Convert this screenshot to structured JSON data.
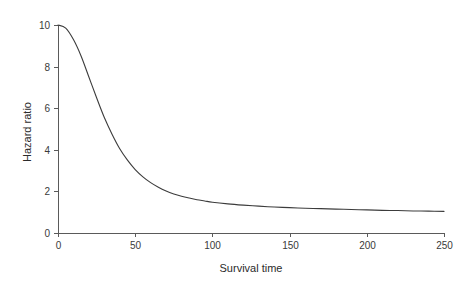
{
  "chart_data": {
    "type": "line",
    "title": "",
    "xlabel": "Survival time",
    "ylabel": "Hazard ratio",
    "xlim": [
      0,
      250
    ],
    "ylim": [
      0,
      10
    ],
    "xticks": [
      0,
      50,
      100,
      150,
      200,
      250
    ],
    "yticks": [
      0,
      2,
      4,
      6,
      8,
      10
    ],
    "xtick_labels": [
      "0",
      "50",
      "100",
      "150",
      "200",
      "250"
    ],
    "ytick_labels": [
      "0",
      "2",
      "4",
      "6",
      "8",
      "10"
    ],
    "grid": false,
    "legend": null,
    "series": [
      {
        "name": "hazard ratio",
        "color": "#3c3c3c",
        "x": [
          0,
          5,
          10,
          15,
          20,
          25,
          30,
          35,
          40,
          45,
          50,
          55,
          60,
          65,
          70,
          75,
          80,
          85,
          90,
          95,
          100,
          110,
          120,
          130,
          140,
          150,
          160,
          170,
          180,
          190,
          200,
          210,
          220,
          230,
          240,
          250
        ],
        "y": [
          10.0,
          9.85,
          9.3,
          8.5,
          7.5,
          6.5,
          5.55,
          4.75,
          4.05,
          3.5,
          3.05,
          2.7,
          2.42,
          2.2,
          2.02,
          1.88,
          1.77,
          1.68,
          1.6,
          1.54,
          1.48,
          1.4,
          1.34,
          1.29,
          1.25,
          1.22,
          1.19,
          1.17,
          1.15,
          1.13,
          1.11,
          1.09,
          1.08,
          1.06,
          1.05,
          1.04
        ]
      }
    ],
    "annotations": [],
    "axis_color": "#5a5a5a",
    "background_color": "#ffffff"
  },
  "layout": {
    "plot_left_px": 58,
    "plot_right_px": 444,
    "plot_top_px": 25,
    "plot_bottom_px": 233
  }
}
